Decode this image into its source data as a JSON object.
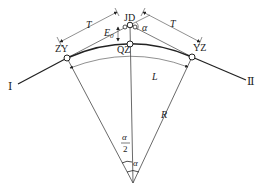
{
  "diagram": {
    "colors": {
      "stroke": "#222222",
      "background": "#ffffff"
    },
    "points": {
      "ZY": {
        "label": "ZY"
      },
      "JD": {
        "label": "JD"
      },
      "QZ": {
        "label": "QZ"
      },
      "YZ": {
        "label": "YZ"
      }
    },
    "labels": {
      "tangent_left": "T",
      "tangent_right": "T",
      "external": "E",
      "external_sub": "0",
      "deflection_at_jd": "α",
      "curve_length": "L",
      "radius": "R",
      "half_angle_num": "α",
      "half_angle_den": "2",
      "center_angle": "α",
      "direction_in": "Ⅰ",
      "direction_out": "Ⅱ"
    }
  }
}
